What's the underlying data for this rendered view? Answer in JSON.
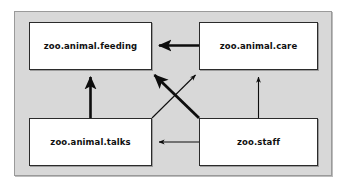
{
  "diagram": {
    "type": "package-dependency-diagram",
    "frame": {
      "border_color": "#9a9a9a",
      "background": "#d8d8d8"
    },
    "nodes": [
      {
        "id": "feeding",
        "label": "zoo.animal.feeding",
        "position": "top-left"
      },
      {
        "id": "care",
        "label": "zoo.animal.care",
        "position": "top-right"
      },
      {
        "id": "talks",
        "label": "zoo.animal.talks",
        "position": "bottom-left"
      },
      {
        "id": "staff",
        "label": "zoo.staff",
        "position": "bottom-right"
      }
    ],
    "edges": [
      {
        "id": "care-to-feeding",
        "from": "care",
        "to": "feeding",
        "style": "thick",
        "direction": "horizontal-left"
      },
      {
        "id": "talks-to-feeding",
        "from": "talks",
        "to": "feeding",
        "style": "thick",
        "direction": "vertical-up"
      },
      {
        "id": "staff-to-feeding",
        "from": "staff",
        "to": "feeding",
        "style": "thick",
        "direction": "diagonal-up-left"
      },
      {
        "id": "talks-to-care",
        "from": "talks",
        "to": "care",
        "style": "thin",
        "direction": "diagonal-up-right"
      },
      {
        "id": "staff-to-care",
        "from": "staff",
        "to": "care",
        "style": "thin",
        "direction": "vertical-up"
      },
      {
        "id": "staff-to-talks",
        "from": "staff",
        "to": "talks",
        "style": "thin",
        "direction": "horizontal-left"
      }
    ],
    "colors": {
      "node_border": "#2b2b2b",
      "node_fill": "#ffffff",
      "edge": "#0d0d0d",
      "text": "#101010"
    }
  }
}
